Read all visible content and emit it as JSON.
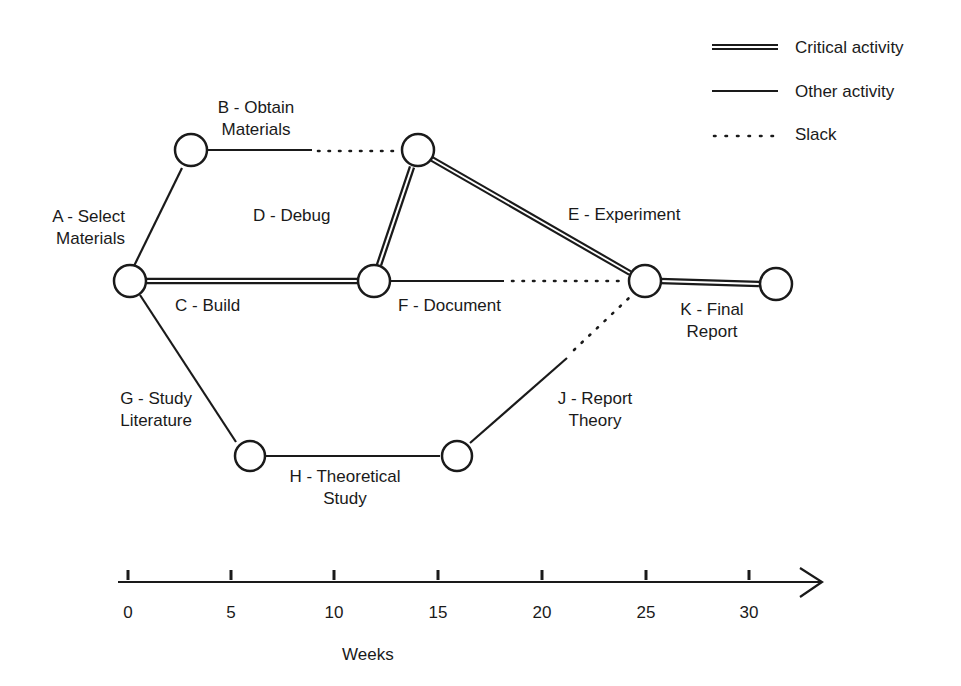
{
  "legend": {
    "critical": "Critical activity",
    "other": "Other activity",
    "slack": "Slack"
  },
  "activities": {
    "A": {
      "line1": "A - Select",
      "line2": "Materials",
      "type": "other"
    },
    "B": {
      "line1": "B - Obtain",
      "line2": "Materials",
      "type": "other"
    },
    "C": {
      "line1": "C - Build",
      "type": "critical"
    },
    "D": {
      "line1": "D - Debug",
      "type": "critical"
    },
    "E": {
      "line1": "E - Experiment",
      "type": "critical"
    },
    "F": {
      "line1": "F - Document",
      "type": "other"
    },
    "G": {
      "line1": "G - Study",
      "line2": "Literature",
      "type": "other"
    },
    "H": {
      "line1": "H - Theoretical",
      "line2": "Study",
      "type": "other"
    },
    "J": {
      "line1": "J - Report",
      "line2": "Theory",
      "type": "other"
    },
    "K": {
      "line1": "K - Final",
      "line2": "Report",
      "type": "critical"
    }
  },
  "axis": {
    "title": "Weeks",
    "ticks": [
      "0",
      "5",
      "10",
      "15",
      "20",
      "25",
      "30"
    ]
  },
  "colors": {
    "line": "#1a1a1a",
    "background": "#ffffff"
  }
}
